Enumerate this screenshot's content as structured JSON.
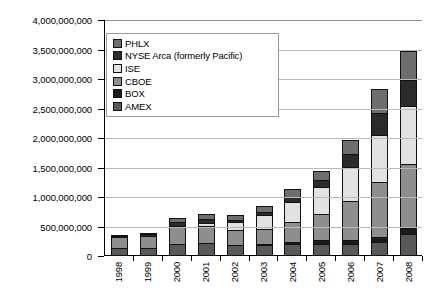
{
  "chart_data": {
    "type": "bar",
    "subtype": "stacked-column",
    "title": "",
    "xlabel": "",
    "ylabel": "",
    "grid": true,
    "legend_position": "inside-top-left",
    "categories": [
      "1998",
      "1999",
      "2000",
      "2001",
      "2002",
      "2003",
      "2004",
      "2005",
      "2006",
      "2007",
      "2008"
    ],
    "ylim": [
      0,
      4000000000
    ],
    "ytick_step": 500000000,
    "ytick_labels": [
      "4,000,000,000",
      "3,500,000,000",
      "3,000,000,000",
      "2,500,000,000",
      "2,000,000,000",
      "1,500,000,000",
      "1,000,000,000",
      "500,000,000",
      "0"
    ],
    "ytick_values": [
      4000000000,
      3500000000,
      3000000000,
      2500000000,
      2000000000,
      1500000000,
      1000000000,
      500000000,
      0
    ],
    "stack_order_bottom_to_top": [
      "AMEX",
      "BOX",
      "CBOE",
      "ISE",
      "NYSE Arca (formerly Pacific)",
      "PHLX"
    ],
    "series": [
      {
        "name": "AMEX",
        "color": "#595959",
        "values": [
          130000000,
          130000000,
          205000000,
          215000000,
          186000000,
          180000000,
          201000000,
          203000000,
          197000000,
          241000000,
          370000000
        ]
      },
      {
        "name": "BOX",
        "color": "#1c1c1c",
        "values": [
          0,
          0,
          0,
          0,
          0,
          10000000,
          49000000,
          78000000,
          94000000,
          106000000,
          120000000
        ]
      },
      {
        "name": "CBOE",
        "color": "#8e8e8e",
        "values": [
          207000000,
          225000000,
          310000000,
          307000000,
          267000000,
          283000000,
          361000000,
          469000000,
          675000000,
          945000000,
          1110000000
        ]
      },
      {
        "name": "ISE",
        "color": "#e2e2e2",
        "values": [
          0,
          0,
          35000000,
          65000000,
          153000000,
          245000000,
          361000000,
          470000000,
          592000000,
          805000000,
          991000000
        ]
      },
      {
        "name": "NYSE Arca (formerly Pacific)",
        "color": "#2b2b2b",
        "values": [
          38000000,
          45000000,
          83000000,
          96000000,
          63000000,
          74000000,
          90000000,
          130000000,
          240000000,
          393000000,
          452000000
        ]
      },
      {
        "name": "PHLX",
        "color": "#6e6e6e",
        "values": [
          32000000,
          35000000,
          85000000,
          98000000,
          88000000,
          114000000,
          152000000,
          175000000,
          250000000,
          422000000,
          524000000
        ]
      }
    ],
    "totals": [
      407000000,
      435000000,
      718000000,
      781000000,
      757000000,
      906000000,
      1214000000,
      1525000000,
      2048000000,
      2912000000,
      3567000000
    ]
  },
  "legend": {
    "entries": [
      {
        "label": "PHLX",
        "color": "#6e6e6e"
      },
      {
        "label": "NYSE Arca (formerly Pacific)",
        "color": "#2b2b2b"
      },
      {
        "label": "ISE",
        "color": "#e2e2e2"
      },
      {
        "label": "CBOE",
        "color": "#8e8e8e"
      },
      {
        "label": "BOX",
        "color": "#1c1c1c"
      },
      {
        "label": "AMEX",
        "color": "#595959"
      }
    ]
  }
}
